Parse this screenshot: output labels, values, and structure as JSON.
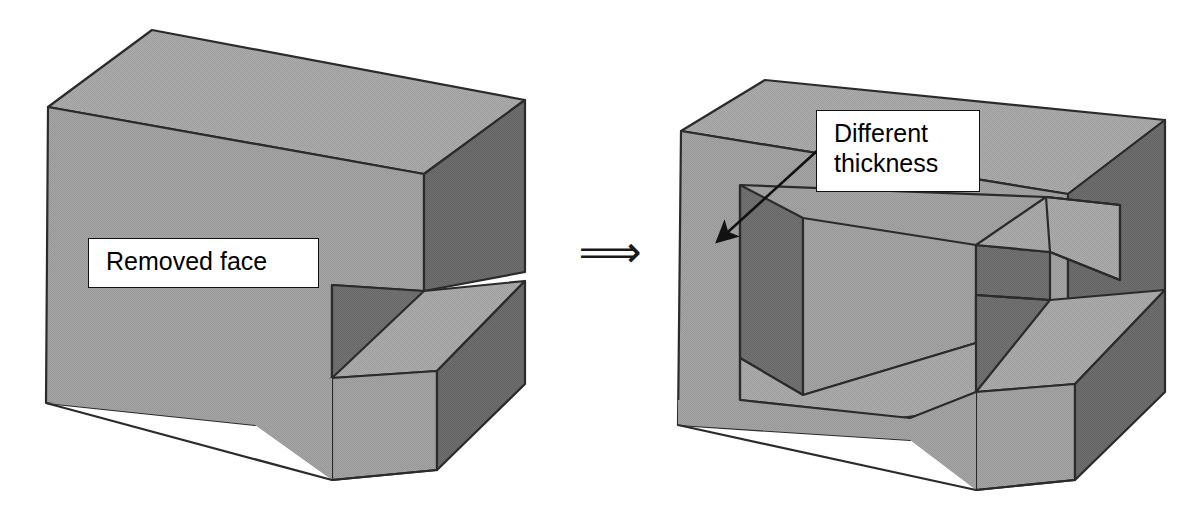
{
  "figure": {
    "type": "technical-diagram",
    "background_color": "#ffffff",
    "palette": {
      "top_face": "#a9a9a9",
      "front_face": "#a3a3a3",
      "side_face_dark": "#6b6b6b",
      "cavity_dark": "#6f6f6f",
      "cavity_floor": "#a0a0a0",
      "outline": "#2b2b2b",
      "label_fill": "#ffffff",
      "label_border": "#111111",
      "label_text": "#000000"
    }
  },
  "transform_symbol": {
    "name": "double-right-arrow",
    "glyph": "⟹"
  },
  "callouts": [
    {
      "id": "removed-face",
      "text": "Removed face",
      "has_leader_line": false
    },
    {
      "id": "different-thickness",
      "text": "Different\nthickness",
      "has_leader_line": true,
      "leader": {
        "from_x": 818,
        "from_y": 150,
        "to_x": 716,
        "to_y": 243
      }
    }
  ],
  "shapes": {
    "left": {
      "name": "solid-block-before",
      "label": "Removed face",
      "outline": "48,107 152,30 525,100 525,272 440,282 440,390 355,401 355,290 255,300 255,425 46,403",
      "faces": {
        "top": "48,107 152,30 525,100 424,174",
        "top_notch_extra": "",
        "front": "48,107 424,174 424,291 355,290 355,401 255,425 46,403",
        "right_dark": "424,174 525,100 525,272 440,282 440,390 355,401 355,290 424,291",
        "notch_inner_dark": "332,285 332,375 420,290 420,200",
        "notch_floor": "332,375 420,290 525,275 440,390"
      }
    },
    "right": {
      "name": "solid-block-after",
      "label": "Different thickness",
      "outline": "681,131 765,80 1165,120 1165,290 1085,300 1085,402 1000,413 1000,303 910,313 910,440 678,425"
    }
  }
}
